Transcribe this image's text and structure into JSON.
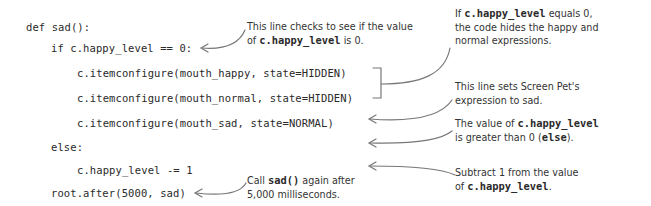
{
  "code": {
    "lines": [
      {
        "text": "def sad():",
        "indent": 0
      },
      {
        "text": "if c.happy_level == 0:",
        "indent": 1
      },
      {
        "text": "c.itemconfigure(mouth_happy, state=HIDDEN)",
        "indent": 2
      },
      {
        "text": "c.itemconfigure(mouth_normal, state=HIDDEN)",
        "indent": 2
      },
      {
        "text": "c.itemconfigure(mouth_sad, state=NORMAL)",
        "indent": 2
      },
      {
        "text": "else:",
        "indent": 1
      },
      {
        "text": "c.happy_level -= 1",
        "indent": 2
      },
      {
        "text": "root.after(5000, sad)",
        "indent": 1
      }
    ]
  },
  "annotations": {
    "check_zero": {
      "line1": "This line checks to see if the value",
      "line2_prefix": "of ",
      "line2_code": "c.happy_level",
      "line2_suffix": " is 0."
    },
    "hides_expressions": {
      "line1_prefix": "If ",
      "line1_code": "c.happy_level",
      "line1_suffix": " equals 0,",
      "line2": "the code hides the happy and",
      "line3": "normal expressions."
    },
    "sets_sad": {
      "line1": "This line sets Screen Pet's",
      "line2": "expression to sad."
    },
    "greater_than_zero": {
      "line1_prefix": "The value of ",
      "line1_code": "c.happy_level",
      "line2_prefix": "is greater than 0 (",
      "line2_code": "else",
      "line2_suffix": ")."
    },
    "subtract_one": {
      "line1": "Subtract 1 from the value",
      "line2_prefix": "of ",
      "line2_code": "c.happy_level",
      "line2_suffix": "."
    },
    "call_again": {
      "line1_prefix": "Call ",
      "line1_code": "sad()",
      "line1_suffix": " again after",
      "line2": "5,000 milliseconds."
    }
  },
  "colors": {
    "background": "#ffffff",
    "code_text": "#2a2a2a",
    "annotation_text": "#333333",
    "connector": "#777777"
  }
}
